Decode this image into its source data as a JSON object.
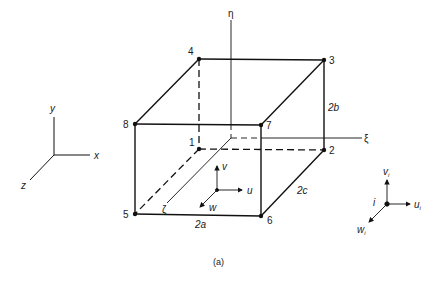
{
  "figure": {
    "caption": "(a)",
    "colors": {
      "line": "#111111",
      "background": "#ffffff"
    }
  },
  "global_axes": {
    "x": "x",
    "y": "y",
    "z": "z"
  },
  "element": {
    "nodes": [
      "1",
      "2",
      "3",
      "4",
      "5",
      "6",
      "7",
      "8"
    ],
    "dimensions": {
      "width": "2a",
      "height": "2b",
      "depth": "2c"
    },
    "natural_axes": {
      "eta": "η",
      "xi": "ξ",
      "zeta": "ζ"
    },
    "displacements": {
      "u": "u",
      "v": "v",
      "w": "w"
    }
  },
  "nodal_dof": {
    "node": "i",
    "u": "u",
    "v": "v",
    "w": "w",
    "sub": "i"
  }
}
